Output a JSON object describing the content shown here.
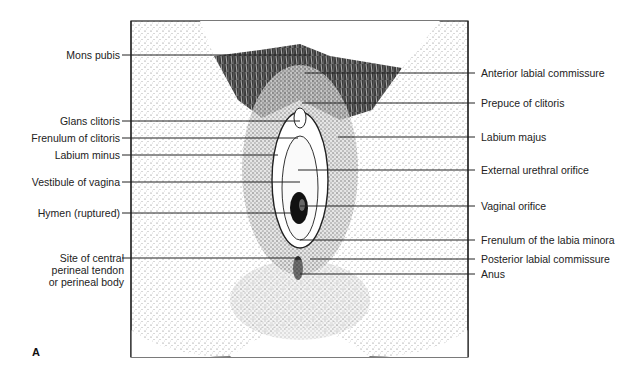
{
  "figure": {
    "letter": "A"
  },
  "labels_left": [
    {
      "text": "Mons pubis",
      "y": 55,
      "line_to_x": 310
    },
    {
      "text": "Glans clitoris",
      "y": 121,
      "line_to_x": 300
    },
    {
      "text": "Frenulum of clitoris",
      "y": 138,
      "line_to_x": 298
    },
    {
      "text": "Labium minus",
      "y": 155,
      "line_to_x": 278
    },
    {
      "text": "Vestibule of vagina",
      "y": 182,
      "line_to_x": 300
    },
    {
      "text": "Hymen (ruptured)",
      "y": 213,
      "line_to_x": 292
    },
    {
      "text": "Site of central\nperineal tendon\nor perineal body",
      "y": 258,
      "line_to_x": 300
    }
  ],
  "labels_right": [
    {
      "text": "Anterior labial commissure",
      "y": 73,
      "line_from_x": 305
    },
    {
      "text": "Prepuce of clitoris",
      "y": 103,
      "line_from_x": 302
    },
    {
      "text": "Labium majus",
      "y": 137,
      "line_from_x": 338
    },
    {
      "text": "External urethral orifice",
      "y": 170,
      "line_from_x": 298
    },
    {
      "text": "Vaginal orifice",
      "y": 206,
      "line_from_x": 300
    },
    {
      "text": "Frenulum of the labia minora",
      "y": 240,
      "line_from_x": 300
    },
    {
      "text": "Posterior labial commissure",
      "y": 259,
      "line_from_x": 310
    },
    {
      "text": "Anus",
      "y": 274,
      "line_from_x": 300
    }
  ],
  "colors": {
    "ink": "#1a1a1a",
    "stipple_light": "#e9e9e9",
    "stipple_mid": "#b5b5b5",
    "hair_dark": "#2a2a2a"
  }
}
